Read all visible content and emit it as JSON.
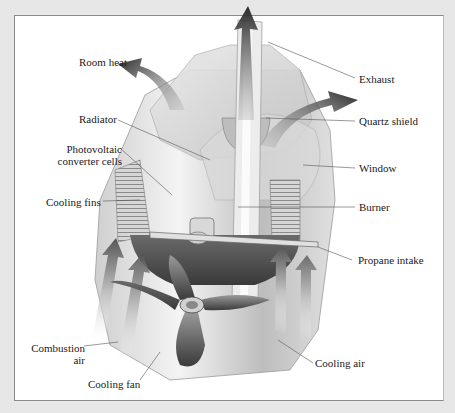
{
  "diagram": {
    "type": "labeled cutaway illustration",
    "colors": {
      "background": "#e7e7e7",
      "panel": "#ffffff",
      "frame_border": "#8a8a8a",
      "arrow_dark": "#2f2f2f",
      "leader_line": "#555555"
    },
    "labels_left": [
      {
        "id": "room-heat",
        "text": "Room heat"
      },
      {
        "id": "radiator",
        "text": "Radiator"
      },
      {
        "id": "photovoltaic",
        "text": "Photovoltaic\nconverter cells"
      },
      {
        "id": "cooling-fins",
        "text": "Cooling fins"
      },
      {
        "id": "combustion-air",
        "text": "Combustion\nair"
      },
      {
        "id": "cooling-fan",
        "text": "Cooling fan"
      }
    ],
    "labels_right": [
      {
        "id": "exhaust",
        "text": "Exhaust"
      },
      {
        "id": "quartz-shield",
        "text": "Quartz shield"
      },
      {
        "id": "window",
        "text": "Window"
      },
      {
        "id": "burner",
        "text": "Burner"
      },
      {
        "id": "propane-intake",
        "text": "Propane intake"
      },
      {
        "id": "cooling-air",
        "text": "Cooling air"
      }
    ],
    "arrows": [
      {
        "id": "exhaust-arrow",
        "meaning": "Exhaust flow upward"
      },
      {
        "id": "room-heat-arrow-left",
        "meaning": "Room heat radiating left"
      },
      {
        "id": "room-heat-arrow-right",
        "meaning": "Room heat radiating right"
      },
      {
        "id": "intake-arrows",
        "meaning": "Air flowing upward into device"
      }
    ]
  }
}
